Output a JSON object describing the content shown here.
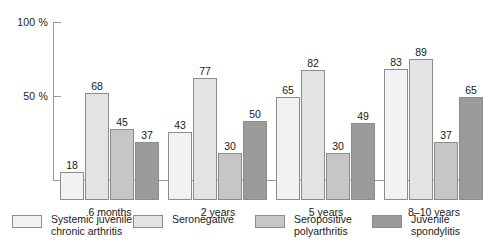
{
  "chart_data": {
    "type": "bar",
    "title": "",
    "xlabel": "",
    "ylabel": "",
    "ylim": [
      0,
      100
    ],
    "yticks": [
      50,
      100
    ],
    "ytick_labels": [
      "50 %",
      "100 %"
    ],
    "grid": false,
    "legend_position": "bottom",
    "categories": [
      "6 months",
      "2 years",
      "5 years",
      "8–10 years"
    ],
    "series": [
      {
        "name": "Systemic juvenile chronic arthritis",
        "legend_line1": "Systemic juvenile",
        "legend_line2": "chronic arthritis",
        "color": "#f2f2f2",
        "values": [
          18,
          43,
          65,
          83
        ]
      },
      {
        "name": "Seronegative",
        "legend_line1": "Seronegative",
        "legend_line2": "",
        "color": "#e3e3e3",
        "values": [
          68,
          77,
          82,
          89
        ]
      },
      {
        "name": "Seropositive polyarthritis",
        "legend_line1": "Seropositive",
        "legend_line2": "polyarthritis",
        "color": "#c6c6c6",
        "values": [
          45,
          30,
          30,
          37
        ]
      },
      {
        "name": "Juvenile spondylitis",
        "legend_line1": "Juvenile",
        "legend_line2": "spondylitis",
        "color": "#9b9b9b",
        "values": [
          37,
          50,
          49,
          65
        ]
      }
    ]
  },
  "axis": {
    "label_100": "100 %",
    "label_50": "50 %"
  }
}
